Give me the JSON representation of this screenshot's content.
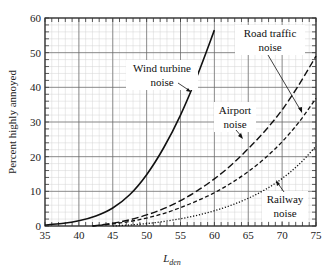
{
  "chart_data": {
    "type": "line",
    "title": "",
    "xlabel": "L_den",
    "xlabel_main": "L",
    "xlabel_sub": "den",
    "ylabel": "Percent highly annoyed",
    "xlim": [
      35,
      75
    ],
    "ylim": [
      0,
      60
    ],
    "xticks": [
      35,
      40,
      45,
      50,
      55,
      60,
      65,
      70,
      75
    ],
    "yticks": [
      0,
      10,
      20,
      30,
      40,
      50,
      60
    ],
    "grid": true,
    "legend": "annotations",
    "series": [
      {
        "name": "Wind turbine noise",
        "style": "solid",
        "x": [
          35,
          37.5,
          40,
          42.5,
          45,
          47.5,
          50,
          52.5,
          55,
          57.5,
          60
        ],
        "values": [
          0.3,
          0.7,
          1.5,
          2.9,
          5.2,
          9.0,
          14.8,
          22.5,
          32.0,
          43.5,
          56.5
        ]
      },
      {
        "name": "Airport noise",
        "style": "long-dash",
        "x": [
          42,
          45,
          47.5,
          50,
          52.5,
          55,
          57.5,
          60,
          62.5,
          65,
          67.5,
          70,
          72.5,
          75
        ],
        "values": [
          0,
          0.8,
          1.8,
          3.2,
          5.0,
          7.3,
          10.2,
          13.6,
          17.6,
          22.3,
          27.5,
          33.5,
          40.8,
          49.0
        ]
      },
      {
        "name": "Road traffic noise",
        "style": "short-dash",
        "x": [
          42,
          45,
          47.5,
          50,
          52.5,
          55,
          57.5,
          60,
          62.5,
          65,
          67.5,
          70,
          72.5,
          75
        ],
        "values": [
          0,
          0.6,
          1.3,
          2.3,
          3.6,
          5.3,
          7.3,
          9.6,
          12.4,
          15.7,
          19.6,
          24.3,
          30.0,
          36.8
        ]
      },
      {
        "name": "Railway noise",
        "style": "dotted",
        "x": [
          45,
          47.5,
          50,
          52.5,
          55,
          57.5,
          60,
          62.5,
          65,
          67.5,
          70,
          72.5,
          75
        ],
        "values": [
          0,
          0.3,
          0.7,
          1.3,
          2.1,
          3.1,
          4.4,
          6.0,
          8.0,
          10.5,
          13.7,
          17.8,
          23.0
        ]
      }
    ],
    "annotations": [
      {
        "lines": [
          "Wind turbine",
          "noise"
        ],
        "target_series": "Wind turbine noise"
      },
      {
        "lines": [
          "Road traffic",
          "noise"
        ],
        "target_series": "Road traffic noise"
      },
      {
        "lines": [
          "Airport",
          "noise"
        ],
        "target_series": "Airport noise"
      },
      {
        "lines": [
          "Railway",
          "noise"
        ],
        "target_series": "Railway noise"
      }
    ]
  }
}
